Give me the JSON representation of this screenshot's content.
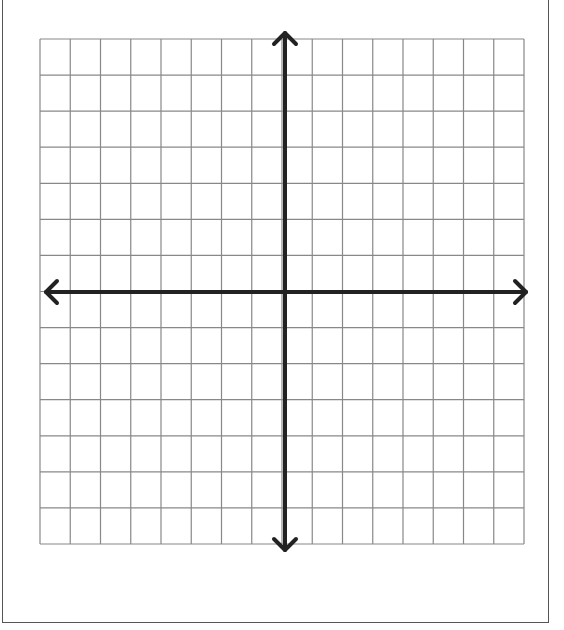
{
  "diagram": {
    "type": "coordinate-plane",
    "grid": {
      "left": 40,
      "top": 39,
      "right": 524,
      "bottom": 544,
      "columns": 16,
      "rows": 14,
      "line_color": "#888888"
    },
    "axes": {
      "origin_x": 285,
      "origin_y": 292,
      "color": "#222222",
      "width": 4,
      "x_axis": {
        "from": 46,
        "to": 526,
        "arrows": "both"
      },
      "y_axis": {
        "from": 33,
        "to": 550,
        "arrows": "both"
      }
    },
    "frame_color": "#555555",
    "labels": []
  }
}
